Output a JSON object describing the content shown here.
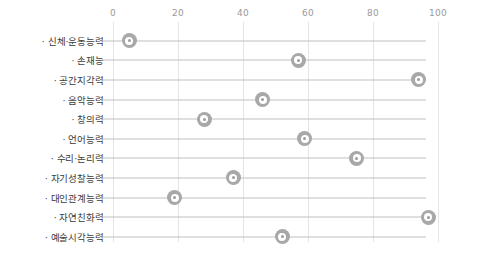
{
  "chart_data": {
    "type": "scatter",
    "title": "",
    "subtitle": "",
    "xlabel": "",
    "ylabel": "",
    "xlim": [
      0,
      100
    ],
    "xticks": [
      0,
      20,
      40,
      60,
      80,
      100
    ],
    "xtick_labels": [
      "0",
      "20",
      "40",
      "60",
      "80",
      "100"
    ],
    "grid": true,
    "legend": "none",
    "orientation": "horizontal",
    "marker_color": "#a8a8a8",
    "line_color": "#bfbfbf",
    "gridline_color": "#e4e4e4",
    "tick_label_color": "#9a9a9a",
    "category_label_color": "#3b3b3b",
    "bullet": "·",
    "categories": [
      "신체·운동능력",
      "손재능",
      "공간지각력",
      "음악능력",
      "창의력",
      "언어능력",
      "수리·논리력",
      "자기성찰능력",
      "대인관계능력",
      "자연친화력",
      "예술시각능력"
    ],
    "values": [
      5,
      57,
      94,
      46,
      28,
      59,
      75,
      37,
      19,
      97,
      52
    ],
    "points": [
      {
        "category": "신체·운동능력",
        "value": 5
      },
      {
        "category": "손재능",
        "value": 57
      },
      {
        "category": "공간지각력",
        "value": 94
      },
      {
        "category": "음악능력",
        "value": 46
      },
      {
        "category": "창의력",
        "value": 28
      },
      {
        "category": "언어능력",
        "value": 59
      },
      {
        "category": "수리·논리력",
        "value": 75
      },
      {
        "category": "자기성찰능력",
        "value": 37
      },
      {
        "category": "대인관계능력",
        "value": 19
      },
      {
        "category": "자연친화력",
        "value": 97
      },
      {
        "category": "예술시각능력",
        "value": 52
      }
    ]
  }
}
